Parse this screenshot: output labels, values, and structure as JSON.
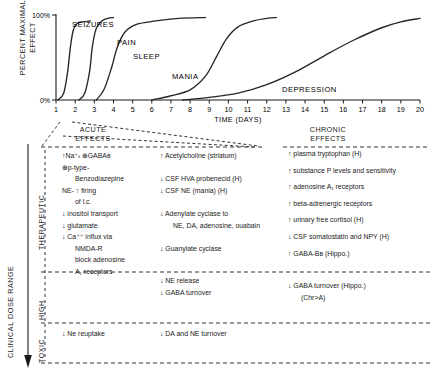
{
  "chart_data": {
    "type": "line",
    "title": "",
    "xlabel": "TIME (DAYS)",
    "ylabel": "PERCENT MAXIMAL\nEFFECT",
    "xlim": [
      1,
      20
    ],
    "ylim": [
      0,
      100
    ],
    "ytick_labels": [
      "100%",
      "0%"
    ],
    "xtick_labels": [
      "1",
      "2",
      "3",
      "4",
      "5",
      "6",
      "7",
      "8",
      "9",
      "10",
      "11",
      "12",
      "13",
      "14",
      "15",
      "16",
      "17",
      "18",
      "19",
      "20"
    ],
    "grid": false,
    "legend": "inline-curve-labels",
    "series": [
      {
        "name": "SEIZURES",
        "onset_day": 1.2,
        "midpoint_day": 1.75,
        "plateau_day": 2.8,
        "plateau_value": 93,
        "x": [
          1.1,
          1.4,
          1.6,
          1.75,
          1.9,
          2.1,
          2.4,
          2.8
        ],
        "y": [
          0,
          8,
          32,
          62,
          82,
          90,
          92,
          93
        ]
      },
      {
        "name": "PAIN",
        "onset_day": 2.2,
        "midpoint_day": 2.9,
        "plateau_day": 4.0,
        "plateau_value": 97,
        "x": [
          2.2,
          2.5,
          2.75,
          2.9,
          3.1,
          3.4,
          3.7,
          4.0
        ],
        "y": [
          0,
          8,
          33,
          63,
          84,
          93,
          96,
          97
        ]
      },
      {
        "name": "SLEEP",
        "onset_day": 3.1,
        "midpoint_day": 4.2,
        "plateau_day": 8.8,
        "plateau_value": 97,
        "x": [
          3.1,
          3.5,
          3.9,
          4.2,
          4.6,
          5.2,
          6.2,
          7.4,
          8.8
        ],
        "y": [
          0,
          12,
          38,
          62,
          80,
          89,
          93,
          96,
          97
        ]
      },
      {
        "name": "MANIA",
        "onset_day": 6.0,
        "midpoint_day": 9.8,
        "plateau_day": 12.5,
        "plateau_value": 97,
        "x": [
          6.0,
          7.0,
          8.0,
          8.8,
          9.4,
          9.9,
          10.5,
          11.3,
          12.0,
          12.5
        ],
        "y": [
          0,
          5,
          12,
          28,
          52,
          72,
          86,
          93,
          96,
          97
        ]
      },
      {
        "name": "DEPRESSION",
        "onset_day": 7.6,
        "midpoint_day": 15.0,
        "plateau_day": 20.0,
        "plateau_value": 96,
        "x": [
          7.6,
          9,
          10.5,
          12,
          13.5,
          15,
          16.5,
          18,
          19,
          20
        ],
        "y": [
          0,
          3,
          8,
          18,
          33,
          52,
          70,
          85,
          92,
          96
        ]
      }
    ]
  },
  "panel": {
    "header_acute": "ACUTE\nEFFECTS",
    "header_chronic": "CHRONIC\nEFFECTS",
    "axis_label": "CLINICAL DOSE RANGE",
    "bands": [
      {
        "label": "THERAPEUTIC"
      },
      {
        "label": "HIGH"
      },
      {
        "label": "TOXIC"
      }
    ],
    "therapeutic": {
      "acute": [
        {
          "text": "↑Na⁺ᵢᵢ ⊕GABAʙ",
          "indent": false
        },
        {
          "text": "⊕p-type-",
          "indent": false
        },
        {
          "text": "Benzodiazepine",
          "indent": true
        },
        {
          "text": "NE- ↑ firing",
          "indent": false
        },
        {
          "text": "of l.c.",
          "indent": true
        },
        {
          "text": "↓ inositol transport",
          "indent": false
        },
        {
          "text": "↓ glutamate",
          "indent": false
        },
        {
          "text": "↓ Ca⁺⁺ influx via",
          "indent": false
        },
        {
          "text": "NMDA-R",
          "indent": true
        },
        {
          "text": "block adenosine",
          "indent": true
        },
        {
          "text": "A₁ receptors",
          "indent": true
        }
      ],
      "middle": [
        {
          "text": "↑ Acetylcholine (striatum)",
          "indent": false
        },
        {
          "text": "",
          "indent": false
        },
        {
          "text": "↓ CSF HVA probenecid (H)",
          "indent": false
        },
        {
          "text": "↓ CSF NE (mania) (H)",
          "indent": false
        },
        {
          "text": "",
          "indent": false
        },
        {
          "text": "↓ Adenylate cyclase to",
          "indent": false
        },
        {
          "text": "NE, DA, adenosine, ouabain",
          "indent": true
        },
        {
          "text": "",
          "indent": false
        },
        {
          "text": "↓ Guanylate cyclase",
          "indent": false
        }
      ],
      "chronic": [
        {
          "text": "↑ plasma tryptophan (H)",
          "indent": false
        },
        {
          "text": "↑ substance P levels and sensitivity",
          "indent": false
        },
        {
          "text": "↑ adenosine A₁ receptors",
          "indent": false
        },
        {
          "text": "↑ beta-adrenergic receptors",
          "indent": false
        },
        {
          "text": "↑ urinary free cortisol (H)",
          "indent": false
        },
        {
          "text": "↓ CSF somatostatin and NPY (H)",
          "indent": false
        },
        {
          "text": "↑ GABA-Bʙ (Hippo.)",
          "indent": false
        }
      ]
    },
    "high": {
      "acute": [],
      "middle": [
        {
          "text": "↓ NE release",
          "indent": false
        },
        {
          "text": "↓ GABA turnover",
          "indent": false
        }
      ],
      "chronic": [
        {
          "text": "↓ GABA turnover (Hippo.)",
          "indent": false
        },
        {
          "text": "(Chr>A)",
          "indent": true
        }
      ]
    },
    "toxic": {
      "acute": [
        {
          "text": "↓ Ne reuptake",
          "indent": false
        }
      ],
      "middle": [
        {
          "text": "↓ DA and NE turnover",
          "indent": false
        }
      ],
      "chronic": []
    }
  },
  "colors": {
    "ink": "#1a1a1a",
    "curve": "#262626",
    "dashed": "#333333"
  }
}
